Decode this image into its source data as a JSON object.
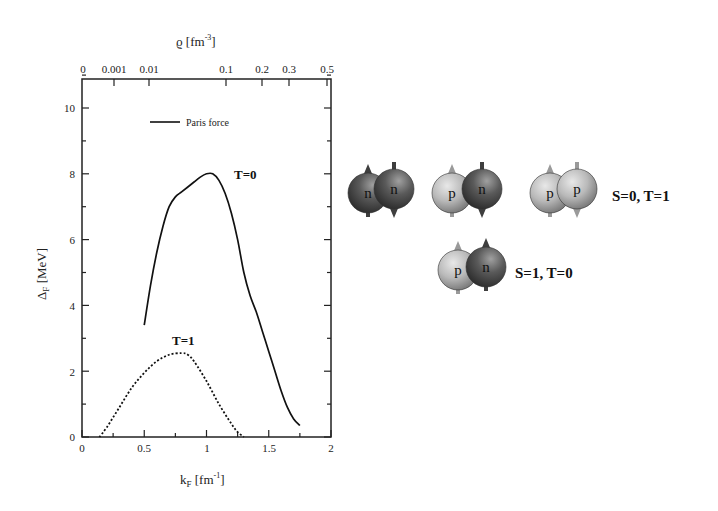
{
  "chart_data": {
    "type": "line",
    "title": "",
    "xlabel": "k_F [fm^-1]",
    "xlabel_main": "k",
    "xlabel_sub": "F",
    "xlabel_unit": " [fm",
    "xlabel_sup": "-1",
    "xlabel_close": "]",
    "ylabel": "Δ_F [MeV]",
    "ylabel_main": "Δ",
    "ylabel_sub": "F",
    "ylabel_unit": " [MeV]",
    "top_xlabel": "ϱ [fm^-3]",
    "top_xlabel_main": "ϱ [fm",
    "top_xlabel_sup": "-3",
    "top_xlabel_close": "]",
    "xlim": [
      0,
      2
    ],
    "ylim": [
      0,
      11
    ],
    "x_ticks": [
      "0",
      "0.5",
      "1",
      "1.5",
      "2"
    ],
    "y_ticks": [
      "0",
      "2",
      "4",
      "6",
      "8",
      "10"
    ],
    "top_ticks": [
      "0",
      "0.001",
      "0.01",
      "0.1",
      "0.2",
      "0.3",
      "0.5"
    ],
    "grid": false,
    "legend": {
      "position": "upper-left",
      "entries": [
        "Paris force"
      ]
    },
    "series": [
      {
        "name": "T=0",
        "style": "solid",
        "x": [
          0.5,
          0.55,
          0.6,
          0.65,
          0.7,
          0.75,
          0.8,
          0.85,
          0.9,
          0.95,
          1.0,
          1.05,
          1.1,
          1.15,
          1.2,
          1.25,
          1.3,
          1.35,
          1.4,
          1.45,
          1.5,
          1.55,
          1.6,
          1.65,
          1.7,
          1.75
        ],
        "y": [
          3.4,
          4.6,
          5.6,
          6.4,
          7.0,
          7.3,
          7.45,
          7.6,
          7.75,
          7.9,
          8.0,
          8.0,
          7.8,
          7.4,
          6.8,
          6.0,
          5.0,
          4.3,
          3.8,
          3.2,
          2.6,
          2.0,
          1.4,
          0.9,
          0.55,
          0.35
        ]
      },
      {
        "name": "T=1",
        "style": "dotted",
        "x": [
          0.14,
          0.2,
          0.3,
          0.4,
          0.5,
          0.6,
          0.7,
          0.8,
          0.85,
          0.9,
          1.0,
          1.1,
          1.2,
          1.25,
          1.3
        ],
        "y": [
          0.0,
          0.3,
          0.9,
          1.5,
          1.95,
          2.3,
          2.5,
          2.55,
          2.5,
          2.3,
          1.7,
          1.0,
          0.4,
          0.15,
          0.0
        ]
      }
    ],
    "annotations": [
      "T=0",
      "T=1",
      "Paris force"
    ]
  },
  "diagram": {
    "pairs": [
      {
        "left": {
          "letter": "n",
          "type": "neutron",
          "spin": "up"
        },
        "right": {
          "letter": "n",
          "type": "neutron",
          "spin": "down"
        }
      },
      {
        "left": {
          "letter": "p",
          "type": "proton",
          "spin": "up"
        },
        "right": {
          "letter": "n",
          "type": "neutron",
          "spin": "down"
        }
      },
      {
        "left": {
          "letter": "p",
          "type": "proton",
          "spin": "up"
        },
        "right": {
          "letter": "p",
          "type": "proton",
          "spin": "down"
        }
      },
      {
        "left": {
          "letter": "p",
          "type": "proton",
          "spin": "up"
        },
        "right": {
          "letter": "n",
          "type": "neutron",
          "spin": "up"
        }
      }
    ],
    "labels": {
      "singlet": "S=0, T=1",
      "triplet": "S=1, T=0"
    },
    "colors": {
      "proton": "#b8b8b8",
      "neutron": "#5a5a5a"
    }
  }
}
